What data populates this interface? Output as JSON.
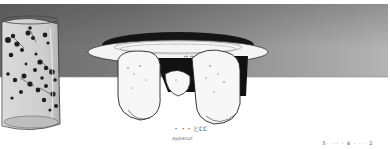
{
  "scene": {
    "description": "Monochrome manga-style panel: patterned glass on the left, upturned plate with two rounded hands beneath it in the center, gray gradient wall and white table",
    "colors": {
      "wall_dark": "#6a6a6a",
      "wall_light": "#b4b4b4",
      "ink": "#1a1a1a",
      "paper": "#ffffff",
      "glass_tint": "#d8d8d8"
    }
  },
  "text": {
    "sound_effect": "・・・とⵎⵎ",
    "caption": "aypanur",
    "corner_note": "3· ··· · ⅲ · · · 2"
  }
}
